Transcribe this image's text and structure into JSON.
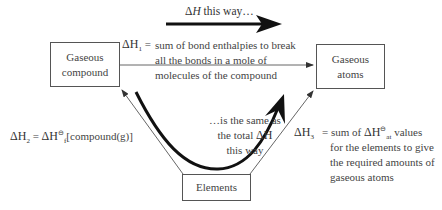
{
  "diagram": {
    "type": "enthalpy-cycle",
    "top_arrow": {
      "delta": "Δ",
      "H": "H",
      "caption": " this way…"
    },
    "boxes": {
      "gaseous_compound": {
        "line1": "Gaseous",
        "line2": "compound"
      },
      "gaseous_atoms": {
        "line1": "Gaseous",
        "line2": "atoms"
      },
      "elements": {
        "label": "Elements"
      }
    },
    "dh1": {
      "symbol": "ΔH",
      "sub": "1",
      "equals": "=",
      "lines": [
        "sum of bond enthalpies to break",
        "all the bonds in a mole of",
        "molecules of the compound"
      ]
    },
    "dh2": {
      "symbol": "ΔH",
      "sub": "2",
      "equals": " = ",
      "rhs_symbol": "ΔH",
      "rhs_sub": "f",
      "rhs_sup": "⊖",
      "rhs_text": "[compound(g)]"
    },
    "dh3": {
      "symbol": "ΔH",
      "sub": "3",
      "equals": "= sum of ",
      "at_symbol": "ΔH",
      "at_sub": "at",
      "at_sup": "⊖",
      "after": " values",
      "lines": [
        "for the elements to give",
        "the required amounts of",
        "gaseous atoms"
      ]
    },
    "curve_caption": {
      "line1": "…is the same as",
      "line2_prefix": "the total ",
      "line2_symbol": "ΔH",
      "line3": "this way"
    },
    "colors": {
      "thin_line": "#666666",
      "thick_arrow": "#111111",
      "box_border": "#555555",
      "text": "#444444"
    }
  }
}
